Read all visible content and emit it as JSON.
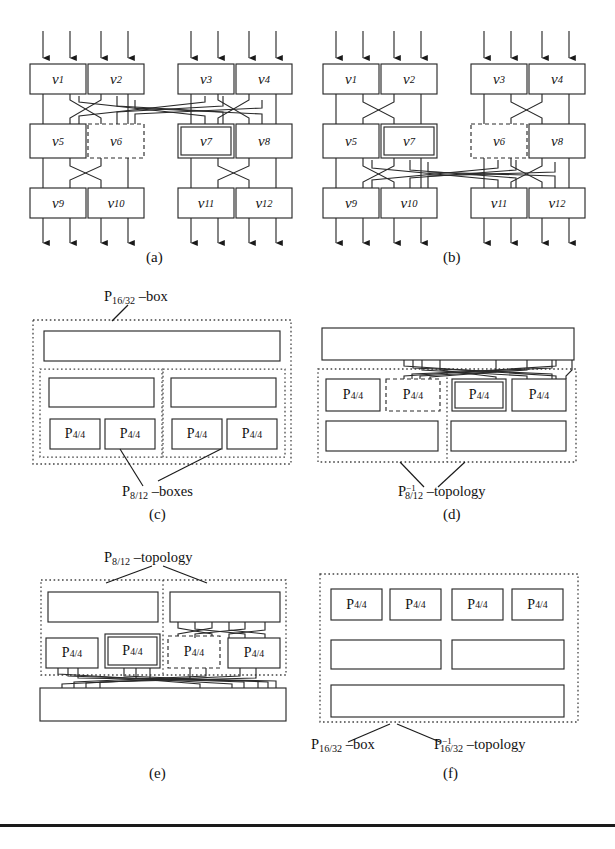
{
  "figure": {
    "panels": [
      {
        "id": "a",
        "letter": "(a)"
      },
      {
        "id": "b",
        "letter": "(b)"
      },
      {
        "id": "c",
        "letter": "(c)"
      },
      {
        "id": "d",
        "letter": "(d)"
      },
      {
        "id": "e",
        "letter": "(e)"
      },
      {
        "id": "f",
        "letter": "(f)"
      }
    ]
  },
  "panel_a": {
    "letter": "(a)",
    "nodes": [
      {
        "id": "v1",
        "label": "v",
        "sub": "1",
        "style": "solid",
        "row": 0,
        "col": 0
      },
      {
        "id": "v2",
        "label": "v",
        "sub": "2",
        "style": "solid",
        "row": 0,
        "col": 1
      },
      {
        "id": "v3",
        "label": "v",
        "sub": "3",
        "style": "solid",
        "row": 0,
        "col": 2
      },
      {
        "id": "v4",
        "label": "v",
        "sub": "4",
        "style": "solid",
        "row": 0,
        "col": 3
      },
      {
        "id": "v5",
        "label": "v",
        "sub": "5",
        "style": "solid",
        "row": 1,
        "col": 0
      },
      {
        "id": "v6",
        "label": "v",
        "sub": "6",
        "style": "dashed",
        "row": 1,
        "col": 1
      },
      {
        "id": "v7",
        "label": "v",
        "sub": "7",
        "style": "double",
        "row": 1,
        "col": 2
      },
      {
        "id": "v8",
        "label": "v",
        "sub": "8",
        "style": "solid",
        "row": 1,
        "col": 3
      },
      {
        "id": "v9",
        "label": "v",
        "sub": "9",
        "style": "solid",
        "row": 2,
        "col": 0
      },
      {
        "id": "v10",
        "label": "v",
        "sub": "10",
        "style": "solid",
        "row": 2,
        "col": 1
      },
      {
        "id": "v11",
        "label": "v",
        "sub": "11",
        "style": "solid",
        "row": 2,
        "col": 2
      },
      {
        "id": "v12",
        "label": "v",
        "sub": "12",
        "style": "solid",
        "row": 2,
        "col": 3
      }
    ],
    "input_arrows": 8,
    "output_arrows": 8,
    "highlight_dashed": "v6",
    "highlight_double": "v7"
  },
  "panel_b": {
    "letter": "(b)",
    "nodes": [
      {
        "id": "v1",
        "label": "v",
        "sub": "1",
        "style": "solid",
        "row": 0,
        "col": 0
      },
      {
        "id": "v2",
        "label": "v",
        "sub": "2",
        "style": "solid",
        "row": 0,
        "col": 1
      },
      {
        "id": "v3",
        "label": "v",
        "sub": "3",
        "style": "solid",
        "row": 0,
        "col": 2
      },
      {
        "id": "v4",
        "label": "v",
        "sub": "4",
        "style": "solid",
        "row": 0,
        "col": 3
      },
      {
        "id": "v5",
        "label": "v",
        "sub": "5",
        "style": "solid",
        "row": 1,
        "col": 0
      },
      {
        "id": "v7",
        "label": "v",
        "sub": "7",
        "style": "double",
        "row": 1,
        "col": 1
      },
      {
        "id": "v6",
        "label": "v",
        "sub": "6",
        "style": "dashed",
        "row": 1,
        "col": 2
      },
      {
        "id": "v8",
        "label": "v",
        "sub": "8",
        "style": "solid",
        "row": 1,
        "col": 3
      },
      {
        "id": "v9",
        "label": "v",
        "sub": "9",
        "style": "solid",
        "row": 2,
        "col": 0
      },
      {
        "id": "v10",
        "label": "v",
        "sub": "10",
        "style": "solid",
        "row": 2,
        "col": 1
      },
      {
        "id": "v11",
        "label": "v",
        "sub": "11",
        "style": "solid",
        "row": 2,
        "col": 2
      },
      {
        "id": "v12",
        "label": "v",
        "sub": "12",
        "style": "solid",
        "row": 2,
        "col": 3
      }
    ],
    "input_arrows": 8,
    "output_arrows": 8,
    "highlight_dashed": "v6",
    "highlight_double": "v7"
  },
  "panel_c": {
    "letter": "(c)",
    "top_label": {
      "base": "P",
      "sub": "16/32",
      "suffix": "–box"
    },
    "bottom_label": {
      "base": "P",
      "sub": "8/12",
      "suffix": "–boxes"
    },
    "cells": [
      {
        "base": "P",
        "sub": "4/4",
        "style": "solid"
      },
      {
        "base": "P",
        "sub": "4/4",
        "style": "solid"
      },
      {
        "base": "P",
        "sub": "4/4",
        "style": "solid"
      },
      {
        "base": "P",
        "sub": "4/4",
        "style": "solid"
      }
    ]
  },
  "panel_d": {
    "letter": "(d)",
    "bottom_label": {
      "base": "P",
      "sub": "8/12",
      "sup": "−1",
      "suffix": "–topology"
    },
    "cells": [
      {
        "base": "P",
        "sub": "4/4",
        "style": "solid"
      },
      {
        "base": "P",
        "sub": "4/4",
        "style": "dashed"
      },
      {
        "base": "P",
        "sub": "4/4",
        "style": "double"
      },
      {
        "base": "P",
        "sub": "4/4",
        "style": "solid"
      }
    ]
  },
  "panel_e": {
    "letter": "(e)",
    "top_label": {
      "base": "P",
      "sub": "8/12",
      "suffix": "–topology"
    },
    "cells": [
      {
        "base": "P",
        "sub": "4/4",
        "style": "solid"
      },
      {
        "base": "P",
        "sub": "4/4",
        "style": "double"
      },
      {
        "base": "P",
        "sub": "4/4",
        "style": "dashed"
      },
      {
        "base": "P",
        "sub": "4/4",
        "style": "solid"
      }
    ]
  },
  "panel_f": {
    "letter": "(f)",
    "label_left": {
      "base": "P",
      "sub": "16/32",
      "suffix": "–box"
    },
    "label_right": {
      "base": "P",
      "sub": "16/32",
      "sup": "−1",
      "suffix": "–topology"
    },
    "cells": [
      {
        "base": "P",
        "sub": "4/4",
        "style": "solid"
      },
      {
        "base": "P",
        "sub": "4/4",
        "style": "solid"
      },
      {
        "base": "P",
        "sub": "4/4",
        "style": "solid"
      },
      {
        "base": "P",
        "sub": "4/4",
        "style": "solid"
      }
    ]
  },
  "colors": {
    "ink": "#1a1a1a",
    "line": "#2a2a2a",
    "dotted": "#444444",
    "background": "#ffffff"
  }
}
